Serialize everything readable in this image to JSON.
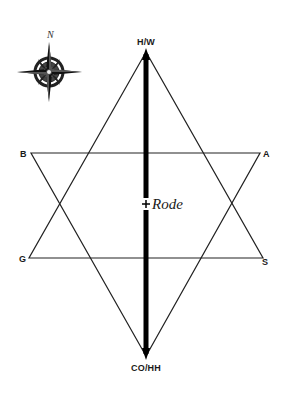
{
  "diagram": {
    "type": "hexagram",
    "colors": {
      "background": "#ffffff",
      "line": "#222222",
      "axis": "#000000"
    },
    "vertices": {
      "top": {
        "label": "H/W",
        "x": 146,
        "y": 52
      },
      "bottom": {
        "label": "CO/HH",
        "x": 146,
        "y": 356
      },
      "upper_left": {
        "label": "B",
        "x": 31,
        "y": 153
      },
      "upper_right": {
        "label": "A",
        "x": 260,
        "y": 153
      },
      "lower_left": {
        "label": "G",
        "x": 29,
        "y": 258
      },
      "lower_right": {
        "label": "S",
        "x": 263,
        "y": 258
      }
    },
    "center": {
      "label": "Rode",
      "marker": "+"
    },
    "compass": {
      "label": "N"
    }
  }
}
